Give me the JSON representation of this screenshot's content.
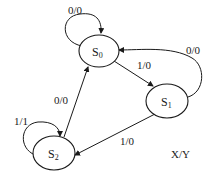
{
  "diagram": {
    "type": "state-machine",
    "legend": "X/Y",
    "states": [
      {
        "id": "S0",
        "base": "S",
        "sub": "0"
      },
      {
        "id": "S1",
        "base": "S",
        "sub": "1"
      },
      {
        "id": "S2",
        "base": "S",
        "sub": "2"
      }
    ],
    "transitions": [
      {
        "from": "S0",
        "to": "S0",
        "label": "0/0"
      },
      {
        "from": "S0",
        "to": "S1",
        "label": "1/0"
      },
      {
        "from": "S1",
        "to": "S0",
        "label": "0/0"
      },
      {
        "from": "S1",
        "to": "S2",
        "label": "1/0"
      },
      {
        "from": "S2",
        "to": "S0",
        "label": "0/0"
      },
      {
        "from": "S2",
        "to": "S2",
        "label": "1/1"
      }
    ]
  }
}
